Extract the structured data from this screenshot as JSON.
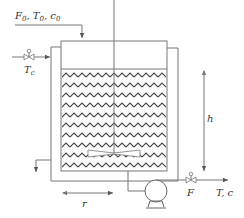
{
  "diagram": {
    "type": "jacketed stirred tank reactor (CSTR) with cooling jacket and pump",
    "labels": {
      "feed": "F₀, T₀, c₀",
      "feed_F": "F",
      "feed_T": "T",
      "feed_c": "c",
      "feed_sub": "0",
      "coolant_T": "T",
      "coolant_sub": "c",
      "height": "h",
      "radius": "r",
      "outlet_flow": "F",
      "outlet_product": "T, c"
    },
    "components": [
      "feed-inlet-line",
      "coolant-inlet-valve",
      "cooling-jacket",
      "reactor-tank",
      "liquid-level",
      "stirrer-shaft",
      "impeller",
      "coolant-outlet-line",
      "tank-outlet-line",
      "pump",
      "outlet-valve",
      "height-dimension-arrow",
      "radius-dimension-arrow"
    ],
    "colors": {
      "line": "#777777",
      "liquid_zigzag": "#444444",
      "text": "#333333"
    }
  }
}
